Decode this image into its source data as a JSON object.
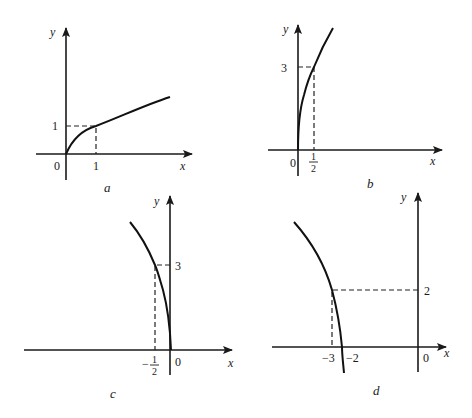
{
  "figure": {
    "panels": [
      {
        "caption": "a",
        "x_label": "x",
        "y_label": "y",
        "origin_label": "0",
        "tick_x": "1",
        "tick_y": "1",
        "marked_point": [
          1,
          1
        ],
        "description": "increasing concave curve starting at origin through (1,1)"
      },
      {
        "caption": "b",
        "x_label": "x",
        "y_label": "y",
        "origin_label": "0",
        "tick_x_num": "1",
        "tick_x_den": "2",
        "tick_y": "3",
        "marked_point": [
          0.5,
          3
        ],
        "description": "steep increasing curve starting at origin through (1/2,3)"
      },
      {
        "caption": "c",
        "x_label": "x",
        "y_label": "y",
        "origin_label": "0",
        "tick_x_sign": "−",
        "tick_x_num": "1",
        "tick_x_den": "2",
        "tick_y": "3",
        "marked_point": [
          -0.5,
          3
        ],
        "description": "mirror of b: curve from origin rising to the left through (-1/2,3)"
      },
      {
        "caption": "d",
        "x_label": "x",
        "y_label": "y",
        "origin_label": "0",
        "tick_x_a": "−3",
        "tick_x_b": "−2",
        "tick_y": "2",
        "marked_point": [
          -3,
          2
        ],
        "description": "curve starting at (-2,0) rising to the left through (-3,2)"
      }
    ]
  }
}
